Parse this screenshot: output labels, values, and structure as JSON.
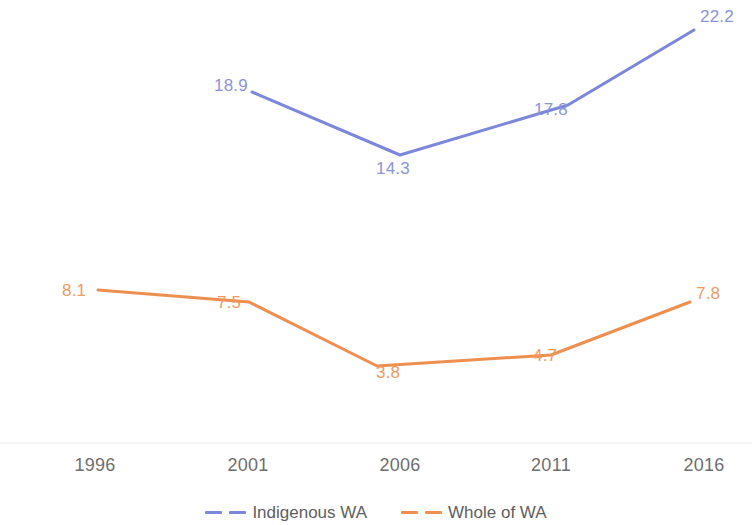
{
  "chart_data": {
    "type": "line",
    "title": "",
    "subtitle": "",
    "xlabel": "",
    "ylabel": "",
    "x": [
      1996,
      2001,
      2006,
      2011,
      2016
    ],
    "categories": [
      "1996",
      "2001",
      "2006",
      "2011",
      "2016"
    ],
    "grid": false,
    "legend_position": "bottom",
    "xlim": [
      1994,
      2018
    ],
    "ylim": [
      0,
      24
    ],
    "series": [
      {
        "name": "Indigenous WA",
        "color": "#7b87d8",
        "label_color": "#8b93d9",
        "line_style": "solid",
        "legend_style": "dashed",
        "values": [
          null,
          18.9,
          14.3,
          17.8,
          22.2
        ],
        "point_labels": [
          "",
          "18.9",
          "14.3",
          "17.8",
          "22.2"
        ]
      },
      {
        "name": "Whole of WA",
        "color": "#ed8f4e",
        "label_color": "#ef9a5f",
        "line_style": "solid",
        "legend_style": "dashed",
        "values": [
          8.1,
          7.5,
          3.8,
          4.7,
          7.8
        ],
        "point_labels": [
          "8.1",
          "7.5",
          "3.8",
          "4.7",
          "7.8"
        ]
      }
    ]
  },
  "axis": {
    "baseline_color": "#f2f2f2",
    "tick_labels": [
      {
        "text": "1996",
        "x": 95
      },
      {
        "text": "2001",
        "x": 248
      },
      {
        "text": "2006",
        "x": 400
      },
      {
        "text": "2011",
        "x": 551
      },
      {
        "text": "2016",
        "x": 704
      }
    ]
  },
  "legend": {
    "entries": [
      {
        "label": "Indigenous WA",
        "color": "#7b87d8"
      },
      {
        "label": "Whole of WA",
        "color": "#ed8f4e"
      }
    ]
  },
  "geometry": {
    "indigenous_points": [
      {
        "x": 252,
        "y": 92
      },
      {
        "x": 400,
        "y": 155
      },
      {
        "x": 568,
        "y": 105
      },
      {
        "x": 694,
        "y": 30
      }
    ],
    "whole_points": [
      {
        "x": 98,
        "y": 290
      },
      {
        "x": 249,
        "y": 302
      },
      {
        "x": 377,
        "y": 366
      },
      {
        "x": 551,
        "y": 355
      },
      {
        "x": 690,
        "y": 302
      }
    ],
    "indigenous_labels": [
      {
        "text": "18.9",
        "x": 214,
        "y": 77
      },
      {
        "text": "14.3",
        "x": 376,
        "y": 160
      },
      {
        "text": "17.8",
        "x": 534,
        "y": 101
      },
      {
        "text": "22.2",
        "x": 700,
        "y": 8
      }
    ],
    "whole_labels": [
      {
        "text": "8.1",
        "x": 62,
        "y": 282
      },
      {
        "text": "7.5",
        "x": 217,
        "y": 294
      },
      {
        "text": "3.8",
        "x": 376,
        "y": 364
      },
      {
        "text": "4.7",
        "x": 533,
        "y": 347
      },
      {
        "text": "7.8",
        "x": 696,
        "y": 285
      }
    ],
    "baseline_y": 443
  }
}
